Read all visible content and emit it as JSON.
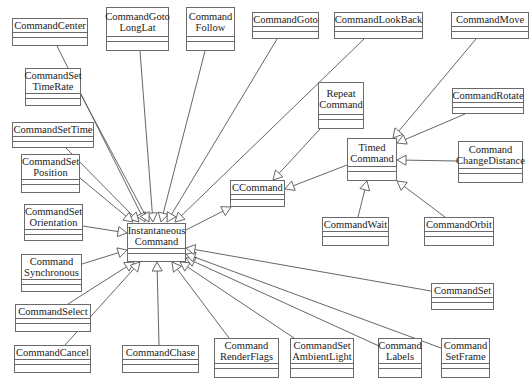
{
  "diagram": {
    "type": "UML class diagram",
    "classes": [
      {
        "id": "CommandCenter",
        "label": "CommandCenter"
      },
      {
        "id": "CommandGotoLongLat",
        "label": "CommandGoto\nLongLat"
      },
      {
        "id": "CommandFollow",
        "label": "Command\nFollow"
      },
      {
        "id": "CommandGoto",
        "label": "CommandGoto"
      },
      {
        "id": "CommandLookBack",
        "label": "CommandLookBack"
      },
      {
        "id": "CommandMove",
        "label": "CommandMove"
      },
      {
        "id": "CommandSetTimeRate",
        "label": "CommandSet\nTimeRate"
      },
      {
        "id": "CommandSetTime",
        "label": "CommandSetTime"
      },
      {
        "id": "CommandSetPosition",
        "label": "CommandSet\nPosition"
      },
      {
        "id": "RepeatCommand",
        "label": "Repeat\nCommand"
      },
      {
        "id": "CommandRotate",
        "label": "CommandRotate"
      },
      {
        "id": "TimedCommand",
        "label": "Timed\nCommand"
      },
      {
        "id": "CommandChangeDistance",
        "label": "Command\nChangeDistance"
      },
      {
        "id": "CCommand",
        "label": "CCommand"
      },
      {
        "id": "CommandSetOrientation",
        "label": "CommandSet\nOrientation"
      },
      {
        "id": "InstantaneousCommand",
        "label": "Instantaneous\nCommand"
      },
      {
        "id": "CommandWait",
        "label": "CommandWait"
      },
      {
        "id": "CommandOrbit",
        "label": "CommandOrbit"
      },
      {
        "id": "CommandSynchronous",
        "label": "Command\nSynchronous"
      },
      {
        "id": "CommandSet",
        "label": "CommandSet"
      },
      {
        "id": "CommandSelect",
        "label": "CommandSelect"
      },
      {
        "id": "CommandCancel",
        "label": "CommandCancel"
      },
      {
        "id": "CommandChase",
        "label": "CommandChase"
      },
      {
        "id": "CommandRenderFlags",
        "label": "Command\nRenderFlags"
      },
      {
        "id": "CommandSetAmbientLight",
        "label": "CommandSet\nAmbientLight"
      },
      {
        "id": "CommandLabels",
        "label": "Command\nLabels"
      },
      {
        "id": "CommandSetFrame",
        "label": "Command\nSetFrame"
      }
    ],
    "generalizations": [
      {
        "child": "CommandCenter",
        "parent": "InstantaneousCommand"
      },
      {
        "child": "CommandGotoLongLat",
        "parent": "InstantaneousCommand"
      },
      {
        "child": "CommandFollow",
        "parent": "InstantaneousCommand"
      },
      {
        "child": "CommandGoto",
        "parent": "InstantaneousCommand"
      },
      {
        "child": "CommandLookBack",
        "parent": "InstantaneousCommand"
      },
      {
        "child": "CommandSetTimeRate",
        "parent": "InstantaneousCommand"
      },
      {
        "child": "CommandSetTime",
        "parent": "InstantaneousCommand"
      },
      {
        "child": "CommandSetPosition",
        "parent": "InstantaneousCommand"
      },
      {
        "child": "CommandSetOrientation",
        "parent": "InstantaneousCommand"
      },
      {
        "child": "CommandSynchronous",
        "parent": "InstantaneousCommand"
      },
      {
        "child": "CommandSelect",
        "parent": "InstantaneousCommand"
      },
      {
        "child": "CommandCancel",
        "parent": "InstantaneousCommand"
      },
      {
        "child": "CommandChase",
        "parent": "InstantaneousCommand"
      },
      {
        "child": "CommandRenderFlags",
        "parent": "InstantaneousCommand"
      },
      {
        "child": "CommandSetAmbientLight",
        "parent": "InstantaneousCommand"
      },
      {
        "child": "CommandLabels",
        "parent": "InstantaneousCommand"
      },
      {
        "child": "CommandSetFrame",
        "parent": "InstantaneousCommand"
      },
      {
        "child": "CommandSet",
        "parent": "InstantaneousCommand"
      },
      {
        "child": "InstantaneousCommand",
        "parent": "CCommand"
      },
      {
        "child": "RepeatCommand",
        "parent": "CCommand"
      },
      {
        "child": "TimedCommand",
        "parent": "CCommand"
      },
      {
        "child": "CommandMove",
        "parent": "TimedCommand"
      },
      {
        "child": "CommandRotate",
        "parent": "TimedCommand"
      },
      {
        "child": "CommandChangeDistance",
        "parent": "TimedCommand"
      },
      {
        "child": "CommandWait",
        "parent": "TimedCommand"
      },
      {
        "child": "CommandOrbit",
        "parent": "TimedCommand"
      }
    ]
  }
}
